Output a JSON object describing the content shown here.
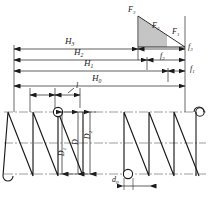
{
  "figure": {
    "type": "engineering-diagram",
    "caption": ""
  },
  "forces": {
    "f3_label": "F",
    "f3_sub": "3",
    "f2_label": "F",
    "f2_sub": "2",
    "f1_label": "F",
    "f1_sub": "1"
  },
  "force_triangle": {
    "hatch_count": 14,
    "description": "right triangle with vertical hatching, hypotenuse from top-left to bottom-right"
  },
  "heights": [
    {
      "label": "H",
      "sub": "3"
    },
    {
      "label": "H",
      "sub": "2"
    },
    {
      "label": "H",
      "sub": "1"
    },
    {
      "label": "H",
      "sub": "0"
    }
  ],
  "deflections": [
    {
      "label": "f",
      "sub": "3"
    },
    {
      "label": "f",
      "sub": "2"
    },
    {
      "label": "f",
      "sub": "1"
    }
  ],
  "diameters": {
    "inner": {
      "label": "D",
      "sub": "1"
    },
    "mean": {
      "label": "D",
      "sub": ""
    },
    "outer": {
      "label": "D",
      "sub": "2"
    },
    "wire": {
      "label": "d",
      "sub": "0"
    }
  },
  "pitch": {
    "label": "l",
    "sub": ""
  },
  "colors": {
    "line": "#1a1a1a",
    "thin_line": "#3a3a3a",
    "center_line": "#555555",
    "background": "#ffffff",
    "text": "#1a1a1a"
  }
}
